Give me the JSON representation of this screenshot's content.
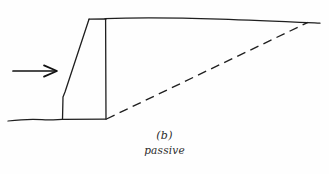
{
  "figure": {
    "kind": "hand-drawn-engineering-sketch",
    "background_color": "#fefefe",
    "ink_color": "#1a1a1a",
    "caption": {
      "letter": "(b)",
      "word": "passive"
    },
    "elements": {
      "force_arrow": {
        "name": "horizontal-force-arrow",
        "direction": "right",
        "shaft_start_x": 13,
        "shaft_start_y": 71,
        "shaft_end_x": 55,
        "shaft_end_y": 71
      },
      "ground_line_left": {
        "name": "left-ground-surface",
        "start_x": 8,
        "start_y": 120,
        "end_x": 62,
        "end_y": 119
      },
      "ground_line_right": {
        "name": "right-ground-surface",
        "start_x": 105,
        "start_y": 18,
        "end_x": 320,
        "end_y": 23
      },
      "wall": {
        "name": "retaining-wall",
        "top_left_x": 89,
        "top_y": 19,
        "top_right_x": 106,
        "base_left_x": 62,
        "base_right_x": 106,
        "base_y": 119,
        "slope_kink_x": 64,
        "slope_kink_y": 96
      },
      "failure_plane": {
        "name": "dashed-failure-plane",
        "start_x": 106,
        "start_y": 119,
        "end_x": 308,
        "end_y": 22,
        "style": "dashed",
        "dash_length": 9,
        "gap_length": 5
      }
    }
  }
}
